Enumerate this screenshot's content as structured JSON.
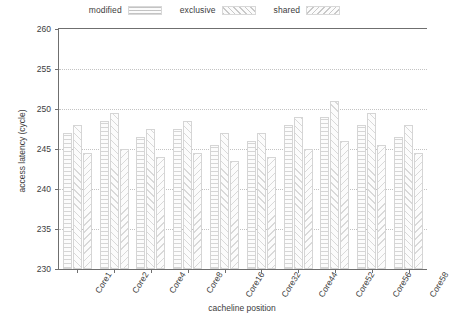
{
  "chart_data": {
    "type": "bar",
    "title": "",
    "subtitle": "",
    "xlabel": "cacheline position",
    "ylabel": "access latency (cycle)",
    "ylim": [
      230,
      260
    ],
    "yticks": [
      230,
      235,
      240,
      245,
      250,
      255,
      260
    ],
    "grid": true,
    "legend_position": "top-center",
    "categories": [
      "Core1",
      "Core2",
      "Core4",
      "Core8",
      "Core16",
      "Core32",
      "Core44",
      "Core52",
      "Core56",
      "Core58"
    ],
    "series": [
      {
        "name": "modified",
        "values": [
          247.0,
          248.5,
          246.5,
          247.5,
          245.5,
          246.0,
          248.0,
          249.0,
          248.0,
          246.5
        ]
      },
      {
        "name": "exclusive",
        "values": [
          248.0,
          249.5,
          247.5,
          248.5,
          247.0,
          247.0,
          249.0,
          251.0,
          249.5,
          248.0
        ]
      },
      {
        "name": "shared",
        "values": [
          244.5,
          245.0,
          244.0,
          244.5,
          243.5,
          244.0,
          245.0,
          246.0,
          245.5,
          244.5
        ]
      }
    ]
  },
  "legend": {
    "entries": [
      {
        "label": "modified",
        "swatch": "swatch-modified"
      },
      {
        "label": "exclusive",
        "swatch": "swatch-exclusive"
      },
      {
        "label": "shared",
        "swatch": "swatch-shared"
      }
    ]
  },
  "colors": {
    "axis": "#6f6f6f",
    "grid": "#c3c3c3",
    "text": "#3c3c3c",
    "bar_fill": "#fcfcfc",
    "bar_edge": "#d5d5d5",
    "background": "#ffffff"
  }
}
